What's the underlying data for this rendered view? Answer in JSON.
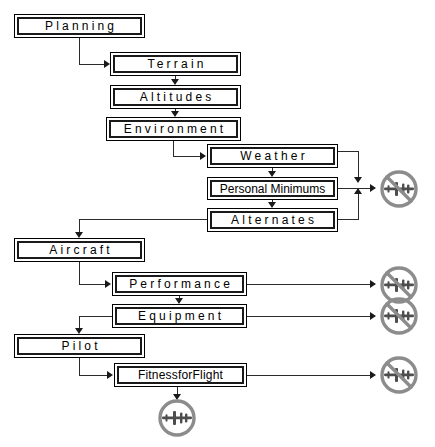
{
  "diagram": {
    "nodes": [
      {
        "id": "planning",
        "label": "Planning",
        "x": 14,
        "y": 14,
        "w": 131,
        "h": 24,
        "spacing": "wide"
      },
      {
        "id": "terrain",
        "label": "Terrain",
        "x": 110,
        "y": 52,
        "w": 131,
        "h": 24,
        "spacing": "wide"
      },
      {
        "id": "altitudes",
        "label": "Altitudes",
        "x": 110,
        "y": 85,
        "w": 131,
        "h": 24,
        "spacing": "wide"
      },
      {
        "id": "environment",
        "label": "Environment",
        "x": 106,
        "y": 117,
        "w": 135,
        "h": 24,
        "spacing": "wide"
      },
      {
        "id": "weather",
        "label": "Weather",
        "x": 207,
        "y": 144,
        "w": 131,
        "h": 24,
        "spacing": "wide"
      },
      {
        "id": "personal-minimums",
        "label": "Personal Minimums",
        "x": 207,
        "y": 177,
        "w": 131,
        "h": 23,
        "spacing": "none"
      },
      {
        "id": "alternates",
        "label": "Alternates",
        "x": 207,
        "y": 208,
        "w": 131,
        "h": 24,
        "spacing": "wide"
      },
      {
        "id": "aircraft",
        "label": "Aircraft",
        "x": 14,
        "y": 238,
        "w": 131,
        "h": 24,
        "spacing": "wide"
      },
      {
        "id": "performance",
        "label": "Performance",
        "x": 112,
        "y": 272,
        "w": 135,
        "h": 24,
        "spacing": "wide"
      },
      {
        "id": "equipment",
        "label": "Equipment",
        "x": 112,
        "y": 304,
        "w": 135,
        "h": 24,
        "spacing": "wide"
      },
      {
        "id": "pilot",
        "label": "Pilot",
        "x": 14,
        "y": 334,
        "w": 131,
        "h": 24,
        "spacing": "wide"
      },
      {
        "id": "fitness-for-flight",
        "label": "FitnessforFlight",
        "x": 114,
        "y": 363,
        "w": 133,
        "h": 24,
        "spacing": "tiny"
      }
    ],
    "icons": [
      {
        "id": "no-fly-weather",
        "kind": "no-fly-icon",
        "x": 377,
        "y": 167,
        "size": 44
      },
      {
        "id": "no-fly-performance",
        "kind": "no-fly-icon",
        "x": 377,
        "y": 263,
        "size": 44
      },
      {
        "id": "no-fly-equipment",
        "kind": "no-fly-icon",
        "x": 377,
        "y": 294,
        "size": 44
      },
      {
        "id": "no-fly-fitness",
        "kind": "no-fly-icon",
        "x": 377,
        "y": 353,
        "size": 44
      },
      {
        "id": "fly-ok-outcome",
        "kind": "fly-icon",
        "x": 155,
        "y": 396,
        "size": 44
      }
    ],
    "colors": {
      "line": "#2b2b2b",
      "box_border": "#1a1a1a",
      "text": "#000000",
      "icon_ring": "#8c8c8c",
      "icon_plane": "#4d4d4d",
      "background": "#ffffff"
    }
  }
}
